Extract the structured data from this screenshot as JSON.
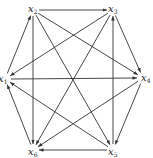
{
  "diagram": {
    "type": "directed-graph",
    "title": "",
    "nodes": [
      {
        "id": "x1",
        "label": "x",
        "sub": "1",
        "x": 5,
        "y": 79,
        "lx": -2,
        "ly": 82
      },
      {
        "id": "x2",
        "label": "x",
        "sub": "2",
        "x": 33,
        "y": 10,
        "lx": 28,
        "ly": 12
      },
      {
        "id": "x3",
        "label": "x",
        "sub": "3",
        "x": 113,
        "y": 10,
        "lx": 108,
        "ly": 12
      },
      {
        "id": "x4",
        "label": "x",
        "sub": "4",
        "x": 143,
        "y": 78,
        "lx": 141,
        "ly": 81
      },
      {
        "id": "x5",
        "label": "x",
        "sub": "5",
        "x": 113,
        "y": 150,
        "lx": 108,
        "ly": 155
      },
      {
        "id": "x6",
        "label": "x",
        "sub": "6",
        "x": 33,
        "y": 150,
        "lx": 28,
        "ly": 155
      }
    ],
    "edges": [
      {
        "from": "x1",
        "to": "x2"
      },
      {
        "from": "x2",
        "to": "x3"
      },
      {
        "from": "x3",
        "to": "x1"
      },
      {
        "from": "x1",
        "to": "x4"
      },
      {
        "from": "x2",
        "to": "x4"
      },
      {
        "from": "x3",
        "to": "x4"
      },
      {
        "from": "x2",
        "to": "x5"
      },
      {
        "from": "x2",
        "to": "x6"
      },
      {
        "from": "x3",
        "to": "x6"
      },
      {
        "from": "x4",
        "to": "x5"
      },
      {
        "from": "x4",
        "to": "x6"
      },
      {
        "from": "x5",
        "to": "x1"
      },
      {
        "from": "x5",
        "to": "x3"
      },
      {
        "from": "x5",
        "to": "x6"
      },
      {
        "from": "x6",
        "to": "x1"
      }
    ],
    "colors": {
      "edge": "#333333",
      "label": "#222222",
      "background": "#ffffff"
    }
  }
}
